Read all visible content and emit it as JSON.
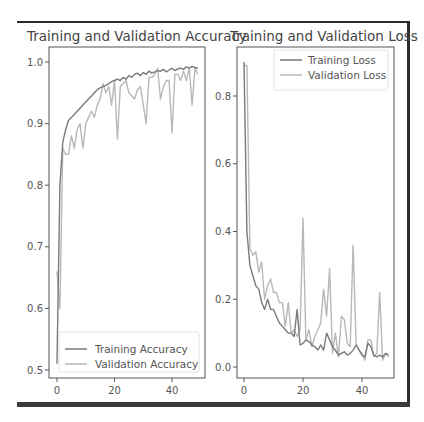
{
  "chart_data": [
    {
      "type": "line",
      "title": "Training and Validation Accuracy",
      "xlabel": "",
      "ylabel": "",
      "xlim": [
        -2,
        51
      ],
      "ylim": [
        0.49,
        1.03
      ],
      "xticks": [
        0,
        20,
        40
      ],
      "yticks": [
        0.5,
        0.6,
        0.7,
        0.8,
        0.9,
        1.0
      ],
      "grid": false,
      "legend_position": "lower right",
      "x": [
        0,
        1,
        2,
        3,
        4,
        5,
        6,
        7,
        8,
        9,
        10,
        11,
        12,
        13,
        14,
        15,
        16,
        17,
        18,
        19,
        20,
        21,
        22,
        23,
        24,
        25,
        26,
        27,
        28,
        29,
        30,
        31,
        32,
        33,
        34,
        35,
        36,
        37,
        38,
        39,
        40,
        41,
        42,
        43,
        44,
        45,
        46,
        47,
        48,
        49
      ],
      "series": [
        {
          "name": "Training Accuracy",
          "color": "#7a7a7a",
          "values": [
            0.51,
            0.8,
            0.87,
            0.89,
            0.905,
            0.91,
            0.915,
            0.92,
            0.925,
            0.93,
            0.935,
            0.94,
            0.945,
            0.95,
            0.955,
            0.958,
            0.96,
            0.962,
            0.965,
            0.968,
            0.97,
            0.972,
            0.97,
            0.975,
            0.972,
            0.978,
            0.975,
            0.98,
            0.982,
            0.978,
            0.983,
            0.98,
            0.985,
            0.982,
            0.984,
            0.986,
            0.985,
            0.988,
            0.984,
            0.987,
            0.99,
            0.986,
            0.989,
            0.99,
            0.988,
            0.992,
            0.99,
            0.993,
            0.991,
            0.99
          ]
        },
        {
          "name": "Validation Accuracy",
          "color": "#b8b8b8",
          "values": [
            0.66,
            0.6,
            0.86,
            0.85,
            0.85,
            0.88,
            0.86,
            0.89,
            0.9,
            0.86,
            0.9,
            0.91,
            0.92,
            0.91,
            0.93,
            0.94,
            0.965,
            0.95,
            0.96,
            0.93,
            0.97,
            0.875,
            0.96,
            0.965,
            0.97,
            0.95,
            0.945,
            0.94,
            0.955,
            0.96,
            0.93,
            0.9,
            0.975,
            0.975,
            0.98,
            0.99,
            0.94,
            0.96,
            0.97,
            0.97,
            0.885,
            0.98,
            0.98,
            0.97,
            0.985,
            0.97,
            0.99,
            0.93,
            0.99,
            0.98
          ]
        }
      ]
    },
    {
      "type": "line",
      "title": "Training and Validation Loss",
      "xlabel": "",
      "ylabel": "",
      "xlim": [
        -2,
        51
      ],
      "ylim": [
        -0.035,
        0.94
      ],
      "xticks": [
        0,
        20,
        40
      ],
      "yticks": [
        0.0,
        0.2,
        0.4,
        0.6,
        0.8
      ],
      "grid": false,
      "legend_position": "upper right",
      "x": [
        0,
        1,
        2,
        3,
        4,
        5,
        6,
        7,
        8,
        9,
        10,
        11,
        12,
        13,
        14,
        15,
        16,
        17,
        18,
        19,
        20,
        21,
        22,
        23,
        24,
        25,
        26,
        27,
        28,
        29,
        30,
        31,
        32,
        33,
        34,
        35,
        36,
        37,
        38,
        39,
        40,
        41,
        42,
        43,
        44,
        45,
        46,
        47,
        48,
        49
      ],
      "series": [
        {
          "name": "Training Loss",
          "color": "#7a7a7a",
          "values": [
            0.9,
            0.4,
            0.3,
            0.27,
            0.24,
            0.23,
            0.19,
            0.17,
            0.2,
            0.17,
            0.17,
            0.15,
            0.13,
            0.12,
            0.11,
            0.1,
            0.1,
            0.09,
            0.17,
            0.065,
            0.07,
            0.08,
            0.075,
            0.065,
            0.06,
            0.05,
            0.065,
            0.05,
            0.1,
            0.08,
            0.06,
            0.05,
            0.035,
            0.04,
            0.045,
            0.035,
            0.04,
            0.05,
            0.065,
            0.05,
            0.035,
            0.03,
            0.07,
            0.06,
            0.035,
            0.03,
            0.035,
            0.03,
            0.04,
            0.035
          ]
        },
        {
          "name": "Validation Loss",
          "color": "#b8b8b8",
          "values": [
            0.89,
            0.89,
            0.35,
            0.33,
            0.34,
            0.28,
            0.31,
            0.2,
            0.24,
            0.26,
            0.22,
            0.22,
            0.19,
            0.19,
            0.12,
            0.19,
            0.1,
            0.11,
            0.09,
            0.11,
            0.44,
            0.08,
            0.11,
            0.06,
            0.09,
            0.11,
            0.13,
            0.23,
            0.15,
            0.29,
            0.04,
            0.1,
            0.03,
            0.15,
            0.14,
            0.07,
            0.06,
            0.36,
            0.07,
            0.05,
            0.04,
            0.02,
            0.08,
            0.08,
            0.03,
            0.04,
            0.22,
            0.02,
            0.04,
            0.03
          ]
        }
      ]
    }
  ],
  "labels": {
    "acc_title": "Training and Validation Accuracy",
    "loss_title": "Training and Validation Loss",
    "acc_legend": [
      "Training Accuracy",
      "Validation Accuracy"
    ],
    "loss_legend": [
      "Training Loss",
      "Validation Loss"
    ],
    "acc_yticks": [
      "1.0",
      "0.9",
      "0.8",
      "0.7",
      "0.6",
      "0.5"
    ],
    "loss_yticks": [
      "0.8",
      "0.6",
      "0.4",
      "0.2",
      "0.0"
    ],
    "xticks": [
      "0",
      "20",
      "40"
    ]
  }
}
